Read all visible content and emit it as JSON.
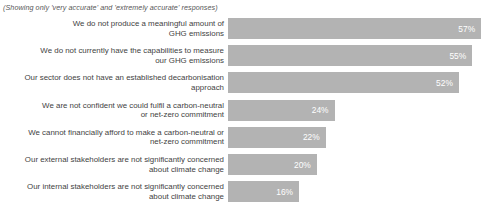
{
  "chart_data": {
    "type": "bar",
    "orientation": "horizontal",
    "title": "",
    "subtitle": "(Showing only 'very accurate' and 'extremely accurate' responses)",
    "xlabel": "",
    "ylabel": "",
    "xlim": [
      0,
      100
    ],
    "grid": false,
    "legend": false,
    "bar_color": "#b3b3b3",
    "value_label_color": "#ffffff",
    "category_label_color": "#3f3f3f",
    "background": "#ffffff",
    "value_suffix": "%",
    "categories": [
      "We do not produce a meaningful amount of\nGHG emissions",
      "We do not currently have the capabilities to measure\nour GHG emissions",
      "Our sector does not have an established decarbonisation\napproach",
      "We are not confident we could fulfil a carbon-neutral\nor net-zero commitment",
      "We cannot financially afford to make a carbon-neutral or\nnet-zero commitment",
      "Our external stakeholders are not significantly concerned\nabout climate change",
      "Our internal stakeholders are not significantly concerned\nabout climate change"
    ],
    "values": [
      57,
      55,
      52,
      24,
      22,
      20,
      16
    ],
    "value_labels": [
      "57%",
      "55%",
      "52%",
      "24%",
      "22%",
      "20%",
      "16%"
    ]
  }
}
